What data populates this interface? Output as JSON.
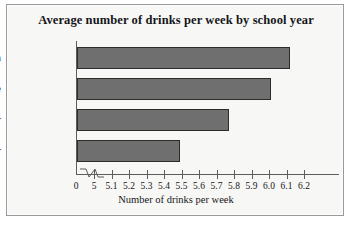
{
  "chart_data": {
    "type": "bar",
    "orientation": "horizontal",
    "title": "Average number of drinks per week by school year",
    "categories": [
      "Freshman",
      "Sophomore",
      "Junior",
      "Senior"
    ],
    "values": [
      6.12,
      6.01,
      5.77,
      5.49
    ],
    "xlabel": "Number of drinks per week",
    "ylabel": "",
    "xlim": [
      5.0,
      6.2
    ],
    "axis_break": true,
    "origin_tick_label": "0",
    "xticks": [
      5.0,
      5.1,
      5.2,
      5.3,
      5.4,
      5.5,
      5.6,
      5.7,
      5.8,
      5.9,
      6.0,
      6.1,
      6.2
    ],
    "xticklabels": [
      "5",
      "5.1",
      "5.2",
      "5.3",
      "5.4",
      "5.5",
      "5.6",
      "5.7",
      "5.8",
      "5.9",
      "6.0",
      "6.1",
      "6.2"
    ],
    "grid": false,
    "legend": null,
    "colors": {
      "bar_fill": "#6f6f6f",
      "bar_border": "#2c2c2c",
      "axis": "#5d5d5d",
      "text": "#15161a",
      "background": "#f7f7f5",
      "frame": "#9a9a9a"
    }
  }
}
